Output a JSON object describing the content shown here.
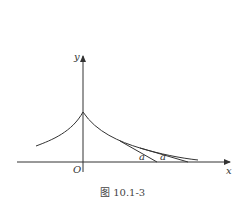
{
  "figure": {
    "caption": "图 10.1-3",
    "axes": {
      "x_label": "x",
      "y_label": "y",
      "origin_label": "O"
    },
    "curve": {
      "description": "symmetric cusp curve (tractrix-like), peak on y-axis, decaying toward x-axis on both sides"
    },
    "tangent_segments": [
      {
        "label": "a",
        "description": "tangent segment from curve to x-axis"
      },
      {
        "label": "a",
        "description": "tangent segment from curve to x-axis"
      }
    ],
    "colors": {
      "stroke": "#333333",
      "background": "#ffffff"
    }
  }
}
